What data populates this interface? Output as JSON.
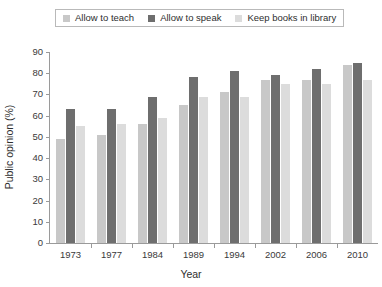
{
  "chart_data": {
    "type": "bar",
    "title": "",
    "xlabel": "Year",
    "ylabel": "Public opinion (%)",
    "categories": [
      "1973",
      "1977",
      "1984",
      "1989",
      "1994",
      "2002",
      "2006",
      "2010"
    ],
    "series": [
      {
        "name": "Allow to teach",
        "color": "#c8c8c8",
        "values": [
          49,
          51,
          56,
          65,
          71,
          77,
          77,
          84
        ]
      },
      {
        "name": "Allow to speak",
        "color": "#6e6e6e",
        "values": [
          63,
          63,
          69,
          78,
          81,
          79,
          82,
          85
        ]
      },
      {
        "name": "Keep books in library",
        "color": "#dcdcdc",
        "values": [
          55,
          56,
          59,
          69,
          69,
          75,
          75,
          77
        ]
      }
    ],
    "ylim": [
      0,
      90
    ],
    "ytick_step": 10,
    "yticks": [
      "0",
      "10",
      "20",
      "30",
      "40",
      "50",
      "60",
      "70",
      "80",
      "90"
    ],
    "grid": false,
    "legend_position": "top",
    "axis_color": "#9a9a9a",
    "text_color": "#3a3a3a",
    "background": "#ffffff"
  }
}
